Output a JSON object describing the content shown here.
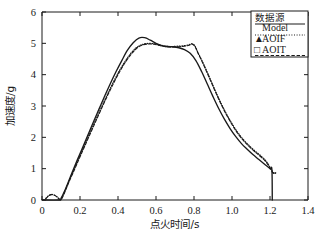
{
  "chart_data": {
    "type": "line",
    "title": "",
    "xlabel": "点火时间/s",
    "ylabel": "加速度/g",
    "xlim": [
      0,
      1.4
    ],
    "ylim": [
      0,
      6
    ],
    "xticks": [
      "0",
      "0.2",
      "0.4",
      "0.6",
      "0.8",
      "1.0",
      "1.2",
      "1.4"
    ],
    "xtick_values": [
      0,
      0.2,
      0.4,
      0.6,
      0.8,
      1.0,
      1.2,
      1.4
    ],
    "yticks": [
      "0",
      "1",
      "2",
      "3",
      "4",
      "5",
      "6"
    ],
    "ytick_values": [
      0,
      1,
      2,
      3,
      4,
      5,
      6
    ],
    "grid": false,
    "legend_position": "top-right",
    "legend_title": "数据源",
    "series": [
      {
        "name": "Model",
        "style": "solid",
        "marker": "none",
        "color": "#1a1a1a",
        "x": [
          0.0,
          0.09,
          0.1,
          0.12,
          0.15,
          0.18,
          0.21,
          0.24,
          0.27,
          0.3,
          0.33,
          0.36,
          0.39,
          0.42,
          0.45,
          0.48,
          0.51,
          0.54,
          0.57,
          0.6,
          0.63,
          0.66,
          0.69,
          0.72,
          0.75,
          0.78,
          0.81,
          0.84,
          0.87,
          0.9,
          0.93,
          0.96,
          0.99,
          1.02,
          1.05,
          1.08,
          1.11,
          1.14,
          1.17,
          1.2,
          1.21,
          1.212
        ],
        "y": [
          0.0,
          0.0,
          0.05,
          0.3,
          0.75,
          1.2,
          1.62,
          2.05,
          2.48,
          2.9,
          3.32,
          3.72,
          4.1,
          4.45,
          4.78,
          5.02,
          5.17,
          5.18,
          5.1,
          5.0,
          4.93,
          4.9,
          4.89,
          4.86,
          4.8,
          4.68,
          4.45,
          4.1,
          3.7,
          3.3,
          2.92,
          2.58,
          2.28,
          2.02,
          1.8,
          1.62,
          1.45,
          1.3,
          1.15,
          1.0,
          0.97,
          0.0
        ]
      },
      {
        "name": "AOIF",
        "style": "dotted",
        "marker": "triangle",
        "color": "#1a1a1a",
        "x": [
          0.02,
          0.035,
          0.05,
          0.065,
          0.08,
          0.09,
          0.1,
          0.115,
          0.14,
          0.17,
          0.2,
          0.23,
          0.26,
          0.29,
          0.32,
          0.35,
          0.38,
          0.41,
          0.44,
          0.47,
          0.5,
          0.53,
          0.56,
          0.59,
          0.62,
          0.65,
          0.68,
          0.71,
          0.74,
          0.77,
          0.79,
          0.805,
          0.82,
          0.85,
          0.88,
          0.91,
          0.94,
          0.97,
          1.0,
          1.03,
          1.06,
          1.09,
          1.12,
          1.15,
          1.18,
          1.205,
          1.215,
          1.225,
          1.23
        ],
        "y": [
          0.05,
          0.14,
          0.18,
          0.16,
          0.1,
          0.04,
          0.02,
          0.2,
          0.58,
          1.0,
          1.42,
          1.83,
          2.25,
          2.66,
          3.06,
          3.45,
          3.82,
          4.16,
          4.45,
          4.7,
          4.88,
          4.97,
          5.0,
          4.99,
          4.95,
          4.91,
          4.9,
          4.91,
          4.92,
          4.95,
          4.99,
          4.92,
          4.72,
          4.35,
          3.94,
          3.52,
          3.12,
          2.76,
          2.44,
          2.16,
          1.93,
          1.74,
          1.57,
          1.42,
          1.24,
          1.0,
          0.9,
          0.86,
          0.88
        ]
      },
      {
        "name": "AOIT",
        "style": "dashed",
        "marker": "square",
        "color": "#1a1a1a",
        "x": [
          0.02,
          0.035,
          0.05,
          0.065,
          0.08,
          0.09,
          0.1,
          0.115,
          0.14,
          0.17,
          0.2,
          0.23,
          0.26,
          0.29,
          0.32,
          0.35,
          0.38,
          0.41,
          0.44,
          0.47,
          0.5,
          0.53,
          0.56,
          0.59,
          0.62,
          0.65,
          0.68,
          0.71,
          0.74,
          0.77,
          0.79,
          0.805,
          0.82,
          0.85,
          0.88,
          0.91,
          0.94,
          0.97,
          1.0,
          1.03,
          1.06,
          1.09,
          1.12,
          1.15,
          1.18,
          1.205,
          1.215,
          1.225,
          1.23
        ],
        "y": [
          0.04,
          0.13,
          0.17,
          0.15,
          0.09,
          0.03,
          0.01,
          0.18,
          0.55,
          0.96,
          1.38,
          1.79,
          2.2,
          2.61,
          3.01,
          3.4,
          3.77,
          4.11,
          4.41,
          4.66,
          4.85,
          4.95,
          4.98,
          4.97,
          4.93,
          4.89,
          4.88,
          4.89,
          4.9,
          4.93,
          4.97,
          4.9,
          4.7,
          4.32,
          3.91,
          3.49,
          3.09,
          2.73,
          2.41,
          2.13,
          1.9,
          1.71,
          1.54,
          1.39,
          1.21,
          0.97,
          0.87,
          0.84,
          0.86
        ]
      }
    ]
  },
  "legend": {
    "title": "数据源",
    "entries": [
      {
        "label": "Model",
        "marker": "",
        "style": "solid"
      },
      {
        "label": "AOIF",
        "marker": "▲",
        "style": "dotted"
      },
      {
        "label": "AOIT",
        "marker": "□",
        "style": "dashed"
      }
    ]
  },
  "axes": {
    "x_title": "点火时间/s",
    "y_title": "加速度/g",
    "x_labels": [
      "0",
      "0.2",
      "0.4",
      "0.6",
      "0.8",
      "1.0",
      "1.2",
      "1.4"
    ],
    "y_labels": [
      "0",
      "1",
      "2",
      "3",
      "4",
      "5",
      "6"
    ]
  },
  "colors": {
    "axis": "#1a1a1a",
    "series": "#1a1a1a",
    "background": "#ffffff"
  }
}
